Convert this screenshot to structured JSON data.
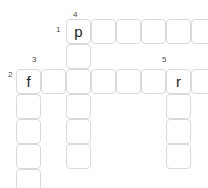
{
  "puzzle": {
    "type": "crossword-grid",
    "cell_size": 25,
    "grid_origin": {
      "x": 16,
      "y": 19
    },
    "colors": {
      "cell_border": "#d8dadc",
      "cell_fill": "#ffffff",
      "letter": "#1c1c1c",
      "clue_number": "#4a4a4a",
      "background": "#ffffff"
    },
    "entries": [
      {
        "number": "1",
        "direction": "across",
        "length": 6,
        "start": {
          "col": 2,
          "row": 0
        },
        "first_letter": "p"
      },
      {
        "number": "2",
        "direction": "across",
        "length": 8,
        "start": {
          "col": 0,
          "row": 2
        },
        "first_letter": "f"
      },
      {
        "number": "3",
        "direction": "down",
        "length": 5,
        "start": {
          "col": 0,
          "row": 2
        },
        "first_letter": "f"
      },
      {
        "number": "4",
        "direction": "down",
        "length": 6,
        "start": {
          "col": 2,
          "row": 0
        },
        "first_letter": "p"
      },
      {
        "number": "5",
        "direction": "down",
        "length": 4,
        "start": {
          "col": 6,
          "row": 2
        },
        "first_letter": "r"
      }
    ],
    "cells": [
      {
        "col": 2,
        "row": 0,
        "letter": "p"
      },
      {
        "col": 3,
        "row": 0,
        "letter": ""
      },
      {
        "col": 4,
        "row": 0,
        "letter": ""
      },
      {
        "col": 5,
        "row": 0,
        "letter": ""
      },
      {
        "col": 6,
        "row": 0,
        "letter": ""
      },
      {
        "col": 7,
        "row": 0,
        "letter": ""
      },
      {
        "col": 2,
        "row": 1,
        "letter": ""
      },
      {
        "col": 0,
        "row": 2,
        "letter": "f"
      },
      {
        "col": 1,
        "row": 2,
        "letter": ""
      },
      {
        "col": 2,
        "row": 2,
        "letter": ""
      },
      {
        "col": 3,
        "row": 2,
        "letter": ""
      },
      {
        "col": 4,
        "row": 2,
        "letter": ""
      },
      {
        "col": 5,
        "row": 2,
        "letter": ""
      },
      {
        "col": 6,
        "row": 2,
        "letter": "r"
      },
      {
        "col": 7,
        "row": 2,
        "letter": ""
      },
      {
        "col": 0,
        "row": 3,
        "letter": ""
      },
      {
        "col": 2,
        "row": 3,
        "letter": ""
      },
      {
        "col": 6,
        "row": 3,
        "letter": ""
      },
      {
        "col": 0,
        "row": 4,
        "letter": ""
      },
      {
        "col": 2,
        "row": 4,
        "letter": ""
      },
      {
        "col": 6,
        "row": 4,
        "letter": ""
      },
      {
        "col": 0,
        "row": 5,
        "letter": ""
      },
      {
        "col": 2,
        "row": 5,
        "letter": ""
      },
      {
        "col": 6,
        "row": 5,
        "letter": ""
      },
      {
        "col": 0,
        "row": 6,
        "letter": ""
      }
    ],
    "clue_numbers": [
      {
        "label": "1",
        "x": 56,
        "y": 26
      },
      {
        "label": "2",
        "x": 8,
        "y": 71
      },
      {
        "label": "3",
        "x": 32,
        "y": 56
      },
      {
        "label": "4",
        "x": 73,
        "y": 11
      },
      {
        "label": "5",
        "x": 162,
        "y": 56
      }
    ]
  }
}
